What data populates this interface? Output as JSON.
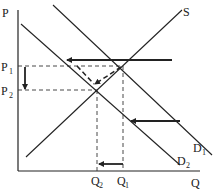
{
  "diagram": {
    "type": "supply-demand",
    "axes": {
      "y_label": "P",
      "x_label": "Q"
    },
    "curves": {
      "supply": {
        "label": "S"
      },
      "demand_1": {
        "label": "D",
        "sub": "1"
      },
      "demand_2": {
        "label": "D",
        "sub": "2"
      }
    },
    "price_levels": [
      {
        "label": "P",
        "sub": "1"
      },
      {
        "label": "P",
        "sub": "2"
      }
    ],
    "quantity_levels": [
      {
        "label": "Q",
        "sub": "2"
      },
      {
        "label": "Q",
        "sub": "1"
      }
    ],
    "annotations": [
      "Demand shifts left from D1 to D2",
      "Price falls from P1 to P2",
      "Quantity falls from Q1 to Q2",
      "Equilibrium moves along S from (Q1,P1) to (Q2,P2)"
    ],
    "colors": {
      "line": "#222222",
      "background": "#ffffff"
    }
  }
}
